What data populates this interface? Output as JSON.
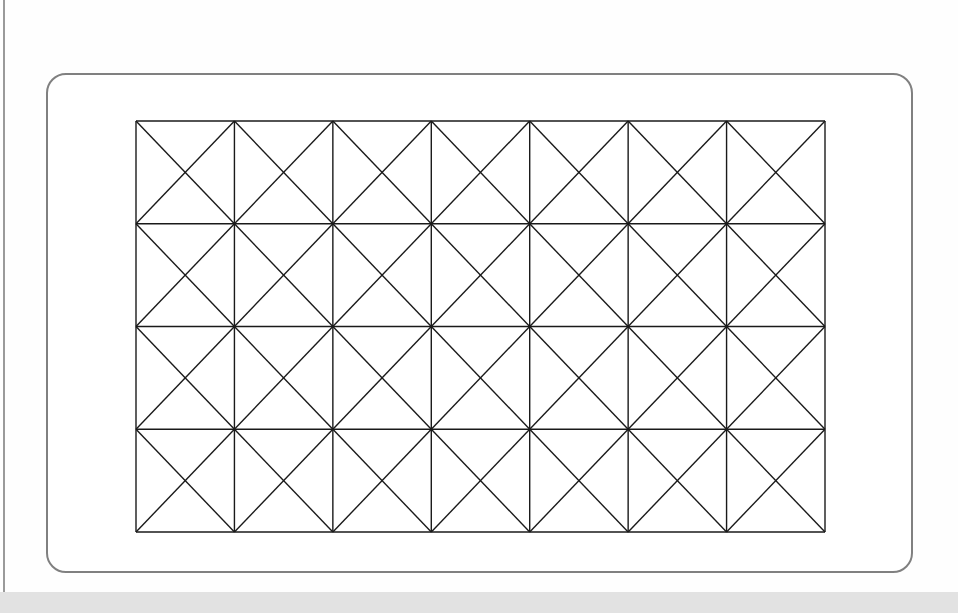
{
  "canvas": {
    "width": 958,
    "height": 613,
    "background_color": "#fefefe",
    "left_rule_color": "#9a9a9a",
    "bottom_band_color": "#e2e2e2"
  },
  "panel": {
    "name": "rounded-panel",
    "x": 46,
    "y": 73,
    "width": 867,
    "height": 500,
    "border_color": "#808080",
    "border_width": 2,
    "corner_radius": 20,
    "fill_color": "#ffffff"
  },
  "chart_data": {
    "type": "diagram",
    "title": "",
    "subtitle": "",
    "xlabel": "",
    "ylabel": "",
    "grid": {
      "columns": 7,
      "rows": 4,
      "cell_width": 98.43,
      "cell_height": 102.75,
      "origin_x": 134,
      "origin_y": 119,
      "total_width": 689,
      "total_height": 411,
      "vertical_line_x": [
        0,
        98.43,
        196.86,
        295.29,
        393.71,
        492.14,
        590.57,
        689
      ],
      "horizontal_line_y": [
        0,
        102.75,
        205.5,
        308.25,
        411
      ],
      "line_color": "#1a1a1a",
      "line_width": 1.4,
      "diagonals": "both",
      "diagonal_line_color": "#1a1a1a",
      "diagonal_line_width": 1.4,
      "cell_count": 28,
      "diagonal_count": 56,
      "vertical_line_count": 8,
      "horizontal_line_count": 5,
      "grid_on": true,
      "legend_position": "none"
    }
  }
}
